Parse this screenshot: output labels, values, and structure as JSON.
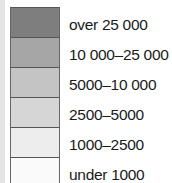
{
  "legend": {
    "items": [
      {
        "label": "over 25 000",
        "color": "#7e7e7e"
      },
      {
        "label": "10 000–25 000",
        "color": "#a6a6a6"
      },
      {
        "label": "5000–10 000",
        "color": "#c4c4c4"
      },
      {
        "label": "2500–5000",
        "color": "#d6d6d6"
      },
      {
        "label": "1000–2500",
        "color": "#ededed"
      },
      {
        "label": "under 1000",
        "color": "#fafafa"
      }
    ]
  }
}
